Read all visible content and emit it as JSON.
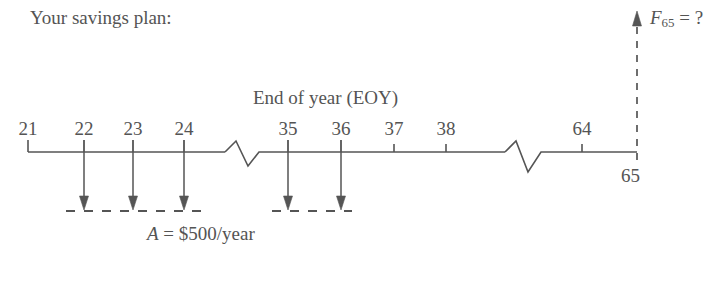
{
  "title": "Your savings plan:",
  "axis_label": "End of year (EOY)",
  "cash_flow_label": "A = $500/year",
  "future_value_label": "F65 = ?",
  "end_year_label": "65",
  "stroke_color": "#555555",
  "text_color": "#545454",
  "background_color": "#ffffff",
  "year_labels": [
    {
      "text": "21",
      "x": 28
    },
    {
      "text": "22",
      "x": 84
    },
    {
      "text": "23",
      "x": 133
    },
    {
      "text": "24",
      "x": 184
    },
    {
      "text": "35",
      "x": 288
    },
    {
      "text": "36",
      "x": 341
    },
    {
      "text": "37",
      "x": 394
    },
    {
      "text": "38",
      "x": 446
    },
    {
      "text": "64",
      "x": 582
    }
  ],
  "chart_data": {
    "type": "line",
    "title": "Your savings plan:",
    "xlabel": "End of year (EOY)",
    "ylabel": "",
    "axis_ticks": [
      21,
      22,
      23,
      24,
      35,
      36,
      37,
      38,
      64,
      65
    ],
    "axis_breaks": [
      [
        24,
        35
      ],
      [
        38,
        64
      ]
    ],
    "cash_flows": [
      {
        "year": 22,
        "direction": "down",
        "label": "A = $500/year",
        "amount": -500
      },
      {
        "year": 23,
        "direction": "down",
        "label": "A = $500/year",
        "amount": -500
      },
      {
        "year": 24,
        "direction": "down",
        "label": "A = $500/year",
        "amount": -500
      },
      {
        "year": 35,
        "direction": "down",
        "label": "A = $500/year",
        "amount": -500
      },
      {
        "year": 36,
        "direction": "down",
        "label": "A = $500/year",
        "amount": -500
      }
    ],
    "unknown": {
      "year": 65,
      "direction": "up",
      "label": "F65 = ?",
      "symbol": "F",
      "subscript": "65",
      "value": "?"
    },
    "annotations": [
      "A = $500/year",
      "F65 = ?",
      "End of year (EOY)",
      "Your savings plan:"
    ],
    "grid": false,
    "legend": "none"
  }
}
